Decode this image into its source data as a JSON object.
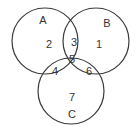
{
  "diagram": {
    "type": "venn",
    "sets": [
      {
        "name": "A",
        "cx": 45,
        "cy": 41,
        "r": 33,
        "label_x": 43,
        "label_y": 24
      },
      {
        "name": "B",
        "cx": 96,
        "cy": 41,
        "r": 33,
        "label_x": 107,
        "label_y": 27
      },
      {
        "name": "C",
        "cx": 71,
        "cy": 91,
        "r": 33,
        "label_x": 72,
        "label_y": 118
      }
    ],
    "regions": [
      {
        "label": "2",
        "description": "A only",
        "x": 49,
        "y": 48
      },
      {
        "label": "3",
        "description": "A and B only",
        "x": 74,
        "y": 46
      },
      {
        "label": "1",
        "description": "B only",
        "x": 99,
        "y": 48
      },
      {
        "label": "5",
        "description": "A, B and C",
        "x": 72,
        "y": 63
      },
      {
        "label": "4",
        "description": "A and C only",
        "x": 55,
        "y": 75
      },
      {
        "label": "6",
        "description": "B and C only",
        "x": 89,
        "y": 75
      },
      {
        "label": "7",
        "description": "C only",
        "x": 72,
        "y": 101
      }
    ],
    "stroke_color": "#3a3a3a",
    "text_color": "#333333"
  }
}
